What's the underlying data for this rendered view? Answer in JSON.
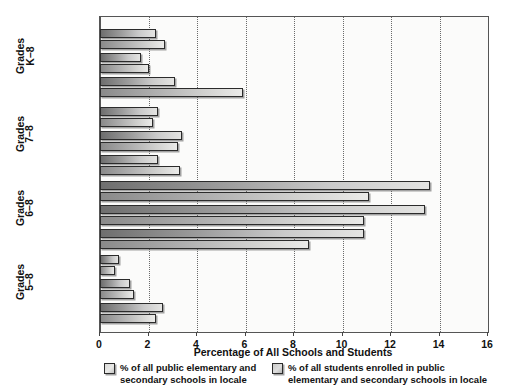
{
  "chart_data": {
    "type": "bar",
    "orientation": "horizontal",
    "title": "",
    "xlabel": "Percentage of All Schools and Students",
    "ylabel": "",
    "xlim": [
      0,
      16
    ],
    "xticks": [
      0,
      2,
      4,
      6,
      8,
      10,
      12,
      14,
      16
    ],
    "grid": "vertical-dotted",
    "legend_position": "bottom",
    "groups": [
      {
        "group_label_line1": "Grades",
        "group_label_line2": "K–8",
        "categories": [
          "Urban",
          "Suburban",
          "Rural"
        ],
        "series": [
          {
            "name": "% of all public elementary and secondary schools in locale",
            "values": [
              2.3,
              1.7,
              3.1
            ]
          },
          {
            "name": "% of all students enrolled in public elementary and secondary schools in locale",
            "values": [
              2.7,
              2.0,
              5.9
            ]
          }
        ]
      },
      {
        "group_label_line1": "Grades",
        "group_label_line2": "7–8",
        "categories": [
          "Urban",
          "Suburban",
          "Rural"
        ],
        "series": [
          {
            "name": "% of all public elementary and secondary schools in locale",
            "values": [
              2.4,
              3.4,
              2.4
            ]
          },
          {
            "name": "% of all students enrolled in public elementary and secondary schools in locale",
            "values": [
              2.2,
              3.2,
              3.3
            ]
          }
        ]
      },
      {
        "group_label_line1": "Grades",
        "group_label_line2": "6–8",
        "categories": [
          "Urban",
          "Suburban",
          "Rural"
        ],
        "series": [
          {
            "name": "% of all public elementary and secondary schools in locale",
            "values": [
              13.6,
              13.4,
              10.9
            ]
          },
          {
            "name": "% of all students enrolled in public elementary and secondary schools in locale",
            "values": [
              11.1,
              10.9,
              8.6
            ]
          }
        ]
      },
      {
        "group_label_line1": "Grades",
        "group_label_line2": "5–8",
        "categories": [
          "Urban",
          "Suburban",
          "Rural"
        ],
        "series": [
          {
            "name": "% of all public elementary and secondary schools in locale",
            "values": [
              0.8,
              1.25,
              2.6
            ]
          },
          {
            "name": "% of all students enrolled in public elementary and secondary schools in locale",
            "values": [
              0.6,
              1.4,
              2.3
            ]
          }
        ]
      }
    ]
  },
  "axis": {
    "xlabel": "Percentage of All Schools and Students",
    "tick_labels": [
      "0",
      "2",
      "4",
      "6",
      "8",
      "10",
      "12",
      "14",
      "16"
    ]
  },
  "legend": {
    "items": [
      {
        "label": "% of all public elementary and\nsecondary schools in locale",
        "series": "schools",
        "color": "#dcdcda"
      },
      {
        "label": "% of all students enrolled in public\nelementary and secondary schools in locale",
        "series": "students",
        "color": "#cacac8"
      }
    ]
  },
  "colors": {
    "schools_bar": "#9d9d9d",
    "students_bar": "#c2c2c0",
    "frame": "#555555",
    "gridline": "#6a6a6a",
    "background": "#ffffff",
    "plot_background": "#fbfbfa"
  }
}
